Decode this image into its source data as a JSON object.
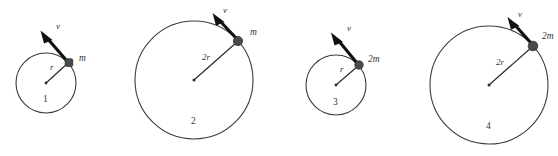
{
  "figure": {
    "background_color": "#ffffff",
    "stroke_color": "#3c3c3c",
    "mass_color": "#4a4a4a",
    "arrow_color": "#111111",
    "label_color": "#333333",
    "baseline_color": "#e3e3e3"
  },
  "panels": [
    {
      "id": "1",
      "number_label": "1",
      "radius_label": "r",
      "mass_label": "m",
      "velocity_label": "v",
      "cx": 46,
      "cy": 83,
      "r": 30,
      "mass_x": 69,
      "mass_y": 63,
      "mass_size": 7.5,
      "arrow_tip_x": 42,
      "arrow_tip_y": 30,
      "radius_text_x": 50,
      "radius_text_y": 70,
      "mass_text_x": 79,
      "mass_text_y": 61,
      "velocity_text_x": 56,
      "velocity_text_y": 29,
      "number_text_x": 43,
      "number_text_y": 102
    },
    {
      "id": "2",
      "number_label": "2",
      "radius_label": "2r",
      "mass_label": "m",
      "velocity_label": "v",
      "cx": 194,
      "cy": 80,
      "r": 59,
      "mass_x": 238,
      "mass_y": 41,
      "mass_size": 9,
      "arrow_tip_x": 214,
      "arrow_tip_y": 13,
      "radius_text_x": 202,
      "radius_text_y": 60,
      "mass_text_x": 250,
      "mass_text_y": 35,
      "velocity_text_x": 223,
      "velocity_text_y": 13,
      "number_text_x": 191,
      "number_text_y": 124
    },
    {
      "id": "3",
      "number_label": "3",
      "radius_label": "r",
      "mass_label": "2m",
      "velocity_label": "v",
      "cx": 336,
      "cy": 85,
      "r": 30,
      "mass_x": 359,
      "mass_y": 65,
      "mass_size": 8,
      "arrow_tip_x": 332,
      "arrow_tip_y": 32,
      "radius_text_x": 340,
      "radius_text_y": 72,
      "mass_text_x": 369,
      "mass_text_y": 62,
      "velocity_text_x": 347,
      "velocity_text_y": 31,
      "number_text_x": 333,
      "number_text_y": 105
    },
    {
      "id": "4",
      "number_label": "4",
      "radius_label": "2r",
      "mass_label": "2m",
      "velocity_label": "v",
      "cx": 489,
      "cy": 85,
      "r": 59,
      "mass_x": 533,
      "mass_y": 46,
      "mass_size": 9,
      "arrow_tip_x": 509,
      "arrow_tip_y": 17,
      "radius_text_x": 496,
      "radius_text_y": 65,
      "mass_text_x": 543,
      "mass_text_y": 38,
      "velocity_text_x": 518,
      "velocity_text_y": 17,
      "number_text_x": 486,
      "number_text_y": 129
    }
  ],
  "baseline": {
    "x1": 5,
    "y1": 148,
    "x2": 290,
    "y2": 148
  }
}
